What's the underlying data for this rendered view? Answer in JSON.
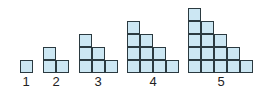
{
  "diagram": {
    "title": "",
    "figures": [
      {
        "label": "1",
        "n": 1,
        "left": 20,
        "label_x": 26
      },
      {
        "label": "2",
        "n": 2,
        "left": 43,
        "label_x": 56
      },
      {
        "label": "3",
        "n": 3,
        "left": 79,
        "label_x": 98
      },
      {
        "label": "4",
        "n": 4,
        "left": 127,
        "label_x": 153
      },
      {
        "label": "5",
        "n": 5,
        "left": 188,
        "label_x": 221
      }
    ],
    "square_size": 13,
    "base_y": 73,
    "colors": {
      "fill": "#cce7f3",
      "stroke": "#2b3a40"
    }
  }
}
